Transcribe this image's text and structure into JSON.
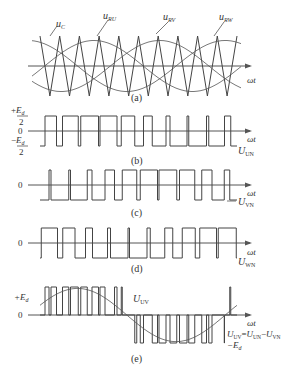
{
  "figure": {
    "axis_label": "ωt",
    "panels": [
      {
        "id": "a",
        "caption": "(a)",
        "labels": {
          "carrier": "u",
          "carrier_sub": "C",
          "ref_u": "u",
          "ref_u_sub": "RU",
          "ref_v": "u",
          "ref_v_sub": "RV",
          "ref_w": "u",
          "ref_w_sub": "RW"
        }
      },
      {
        "id": "b",
        "caption": "(b)",
        "y_top_num": "E",
        "y_top_sub": "d",
        "y_top_den": "2",
        "y_top_sign": "+",
        "y_zero": "0",
        "y_bot_num": "E",
        "y_bot_sub": "d",
        "y_bot_den": "2",
        "y_bot_sign": "−",
        "signal": "U",
        "signal_sub": "UN"
      },
      {
        "id": "c",
        "caption": "(c)",
        "y_zero": "0",
        "signal": "U",
        "signal_sub": "VN"
      },
      {
        "id": "d",
        "caption": "(d)",
        "y_zero": "0",
        "signal": "U",
        "signal_sub": "WN"
      },
      {
        "id": "e",
        "caption": "(e)",
        "y_top": "+E",
        "y_top_sub": "d",
        "y_zero": "0",
        "y_bot": "−E",
        "y_bot_sub": "d",
        "signal": "U",
        "signal_sub": "UV",
        "equation": {
          "lhs": "U",
          "lhs_sub": "UV",
          "eq": "=",
          "t1": "U",
          "t1_sub": "UN",
          "minus": "−",
          "t2": "U",
          "t2_sub": "VN"
        }
      }
    ]
  },
  "diagram": {
    "x_start": 40,
    "x_end": 237,
    "carrier_periods": 10,
    "modulation_index": 0.85,
    "colors": {
      "stroke": "#444444",
      "text": "#333333",
      "background": "#ffffff"
    }
  }
}
